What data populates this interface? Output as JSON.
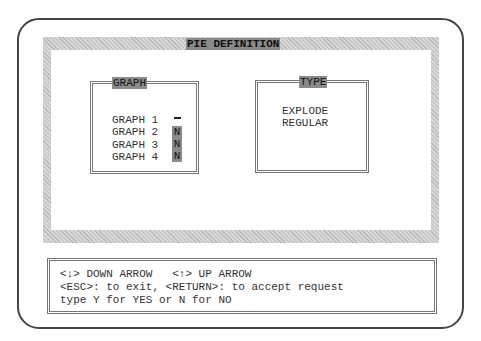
{
  "window": {
    "title": "PIE DEFINITION"
  },
  "graph_panel": {
    "title": "GRAPH",
    "items": [
      {
        "label": "GRAPH 1",
        "value": "",
        "cursor": true
      },
      {
        "label": "GRAPH 2",
        "value": "N"
      },
      {
        "label": "GRAPH 3",
        "value": "N"
      },
      {
        "label": "GRAPH 4",
        "value": "N"
      }
    ]
  },
  "type_panel": {
    "title": "TYPE",
    "options": [
      "EXPLODE",
      "REGULAR"
    ]
  },
  "help": {
    "lines": [
      "<↓> DOWN ARROW   <↑> UP ARROW",
      "<ESC>: to exit, <RETURN>: to accept request",
      "type Y for YES or N for NO"
    ]
  }
}
